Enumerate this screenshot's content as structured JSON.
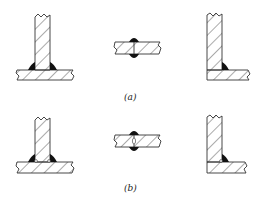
{
  "figure": {
    "rows": [
      {
        "label": "(a)",
        "description": "Welded joints with complete fusion",
        "joints": [
          {
            "type": "T-joint",
            "weld": "double fillet",
            "root_void": false
          },
          {
            "type": "butt joint",
            "weld": "double-sided bead",
            "root_void": false
          },
          {
            "type": "corner joint",
            "weld": "single inside fillet",
            "root_void": false
          }
        ]
      },
      {
        "label": "(b)",
        "description": "Welded joints with incomplete root penetration (voids)",
        "joints": [
          {
            "type": "T-joint",
            "weld": "double fillet",
            "root_void": true
          },
          {
            "type": "butt joint",
            "weld": "double-sided bead",
            "root_void": true
          },
          {
            "type": "corner joint",
            "weld": "single inside fillet",
            "root_void": true
          }
        ]
      }
    ],
    "colors": {
      "line": "#333333",
      "weld": "#111111",
      "background": "#ffffff"
    }
  }
}
